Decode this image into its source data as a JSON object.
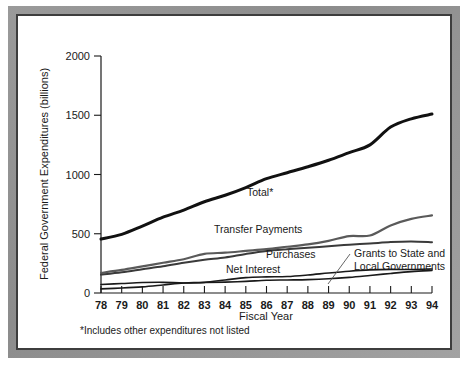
{
  "figure": {
    "footnote": "*Includes other expenditures not listed",
    "frame_color": "#8c8c8c",
    "background_color": "#ffffff"
  },
  "chart_data": {
    "type": "line",
    "title": "",
    "xlabel": "Fiscal Year",
    "ylabel": "Federal Government Expenditures (billions)",
    "xlim": [
      78,
      94
    ],
    "ylim": [
      0,
      2000
    ],
    "yticks": [
      0,
      500,
      1000,
      1500,
      2000
    ],
    "ytick_labels": [
      "0",
      "500",
      "1000",
      "1500",
      "2000"
    ],
    "grid": false,
    "legend_position": "inline-annotations",
    "categories": [
      78,
      79,
      80,
      81,
      82,
      83,
      84,
      85,
      86,
      87,
      88,
      89,
      90,
      91,
      92,
      93,
      94
    ],
    "xtick_labels": [
      "78",
      "79",
      "80",
      "81",
      "82",
      "83",
      "84",
      "85",
      "86",
      "87",
      "88",
      "89",
      "90",
      "91",
      "92",
      "93",
      "94"
    ],
    "series": [
      {
        "name": "Total*",
        "label": "Total*",
        "color": "#111111",
        "width": 3.0,
        "values": [
          455,
          495,
          565,
          640,
          700,
          770,
          825,
          890,
          965,
          1015,
          1065,
          1120,
          1185,
          1250,
          1400,
          1470,
          1510
        ]
      },
      {
        "name": "Transfer Payments",
        "label": "Transfer Payments",
        "color": "#5a5a5a",
        "width": 2.2,
        "values": [
          170,
          195,
          225,
          255,
          285,
          330,
          340,
          355,
          370,
          390,
          410,
          440,
          480,
          485,
          570,
          625,
          655
        ]
      },
      {
        "name": "Purchases",
        "label": "Purchases",
        "color": "#3a3a3a",
        "width": 2.0,
        "values": [
          155,
          175,
          200,
          225,
          255,
          280,
          300,
          330,
          355,
          370,
          382,
          395,
          408,
          418,
          430,
          435,
          428
        ]
      },
      {
        "name": "Net Interest",
        "label": "Net Interest",
        "color": "#1a1a1a",
        "width": 1.6,
        "values": [
          35,
          42,
          52,
          68,
          85,
          90,
          110,
          130,
          136,
          139,
          152,
          169,
          184,
          195,
          199,
          198,
          203
        ]
      },
      {
        "name": "Grants to State and Local Governments",
        "label_line1": "Grants to State and",
        "label_line2": "Local Governments",
        "color": "#1a1a1a",
        "width": 1.6,
        "values": [
          72,
          80,
          88,
          90,
          85,
          88,
          92,
          98,
          107,
          110,
          113,
          120,
          132,
          148,
          165,
          180,
          190
        ]
      }
    ],
    "annotations": [
      {
        "text": "Total*",
        "series": "Total*"
      },
      {
        "text": "Transfer Payments",
        "series": "Transfer Payments"
      },
      {
        "text": "Purchases",
        "series": "Purchases"
      },
      {
        "text": "Net Interest",
        "series": "Net Interest"
      },
      {
        "text": "Grants to State and Local Governments",
        "series": "Grants to State and Local Governments"
      }
    ]
  }
}
